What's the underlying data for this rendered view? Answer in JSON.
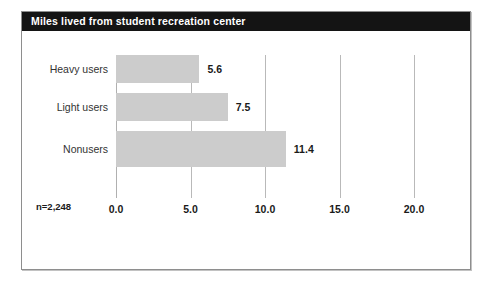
{
  "card": {
    "title": "Miles lived from student recreation center"
  },
  "annotation": {
    "sample_size": "n=2,248"
  },
  "colors": {
    "title_bar": "#141414",
    "title_text": "#ffffff",
    "bar_fill": "#cccccc",
    "gridline": "#b9b9b9",
    "card_border": "#8e8e8e",
    "background": "#ffffff"
  },
  "chart_data": {
    "type": "bar",
    "orientation": "horizontal",
    "title": "Miles lived from student recreation center",
    "xlabel": "",
    "ylabel": "",
    "categories": [
      "Heavy users",
      "Light users",
      "Nonusers"
    ],
    "values": [
      5.6,
      7.5,
      11.4
    ],
    "value_labels": [
      "5.6",
      "7.5",
      "11.4"
    ],
    "xlim": [
      0,
      20
    ],
    "xticks": [
      0,
      5,
      10,
      15,
      20
    ],
    "xtick_labels": [
      "0.0",
      "5.0",
      "10.0",
      "15.0",
      "20.0"
    ],
    "grid": true,
    "legend": false,
    "annotations": [
      "n=2,248"
    ]
  }
}
